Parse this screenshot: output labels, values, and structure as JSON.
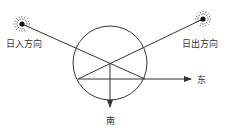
{
  "diagram": {
    "labels": {
      "sunset_direction": "日入方向",
      "sunrise_direction": "日出方向",
      "east": "东",
      "south": "南"
    },
    "icons": {
      "sunset_sun": "sun-icon",
      "sunrise_sun": "sun-icon"
    },
    "colors": {
      "stroke": "#333333",
      "background": "#ffffff"
    }
  }
}
